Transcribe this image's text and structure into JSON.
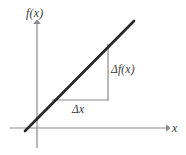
{
  "figure": {
    "background_color": "#ffffff",
    "width": 186,
    "height": 155
  },
  "axes": {
    "y_axis": {
      "label": "f(x)",
      "icon": "up-arrow-icon",
      "color": "#8a8a8a",
      "x": 37,
      "top": 21,
      "bottom": 148
    },
    "x_axis": {
      "label": "x",
      "icon": "right-arrow-icon",
      "color": "#8a8a8a",
      "y": 128,
      "left": 10,
      "right": 169
    }
  },
  "graph": {
    "line": {
      "name": "linear-function-line",
      "color": "#262626",
      "width": 2.6,
      "x1": 25,
      "y1": 131,
      "x2": 134,
      "y2": 21
    },
    "triangle": {
      "color": "#8a8a8a",
      "width": 1.2,
      "corner_x": 108,
      "corner_y": 100,
      "run_start_x": 52,
      "rise_end_y": 44
    }
  },
  "annotations": {
    "rise": {
      "label": "Δf(x)",
      "description": "vertical change of the function"
    },
    "run": {
      "label": "Δx",
      "description": "horizontal change in x"
    }
  },
  "colors": {
    "line": "#262626",
    "axis": "#8a8a8a",
    "text": "#3a3a3a",
    "background": "#ffffff"
  }
}
